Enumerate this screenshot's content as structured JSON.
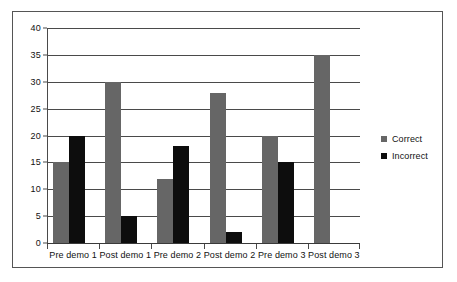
{
  "chart_data": {
    "type": "bar",
    "title": "",
    "subtitle": "",
    "xlabel": "",
    "ylabel": "",
    "ylim": [
      0,
      40
    ],
    "y_ticks": [
      0,
      5,
      10,
      15,
      20,
      25,
      30,
      35,
      40
    ],
    "y_tick_labels": [
      "0",
      "5",
      "10",
      "15",
      "20",
      "25",
      "30",
      "35",
      "40"
    ],
    "grid": "horizontal",
    "legend_position": "right",
    "categories": [
      "Pre demo 1",
      "Post demo 1",
      "Pre demo 2",
      "Post demo 2",
      "Pre demo 3",
      "Post demo 3"
    ],
    "series": [
      {
        "name": "Correct",
        "color": "#666666",
        "values": [
          15,
          30,
          12,
          28,
          20,
          35
        ]
      },
      {
        "name": "Incorrect",
        "color": "#0d0d0d",
        "values": [
          20,
          5,
          18,
          2,
          15,
          0
        ]
      }
    ],
    "annotations": []
  },
  "legend": {
    "items": [
      {
        "label": "Correct",
        "swatch": "gray-square-marker"
      },
      {
        "label": "Incorrect",
        "swatch": "black-square-marker"
      }
    ]
  }
}
